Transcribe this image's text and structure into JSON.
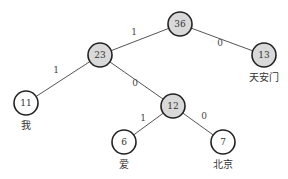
{
  "diagram": {
    "type": "huffman-tree",
    "nodes": [
      {
        "id": "n36",
        "value": "36",
        "kind": "internal"
      },
      {
        "id": "n23",
        "value": "23",
        "kind": "internal"
      },
      {
        "id": "n13",
        "value": "13",
        "kind": "leaf",
        "label": "天安门"
      },
      {
        "id": "n11",
        "value": "11",
        "kind": "leaf",
        "label": "我"
      },
      {
        "id": "n12",
        "value": "12",
        "kind": "internal"
      },
      {
        "id": "n6",
        "value": "6",
        "kind": "leaf",
        "label": "爱"
      },
      {
        "id": "n7",
        "value": "7",
        "kind": "leaf",
        "label": "北京"
      }
    ],
    "edges": [
      {
        "from": "n36",
        "to": "n23",
        "label": "1"
      },
      {
        "from": "n36",
        "to": "n13",
        "label": "0"
      },
      {
        "from": "n23",
        "to": "n11",
        "label": "1"
      },
      {
        "from": "n23",
        "to": "n12",
        "label": "0"
      },
      {
        "from": "n12",
        "to": "n6",
        "label": "1"
      },
      {
        "from": "n12",
        "to": "n7",
        "label": "0"
      }
    ],
    "colors": {
      "internal_fill": "#d9d9d9",
      "leaf_fill": "#ffffff",
      "stroke": "#222222"
    }
  }
}
